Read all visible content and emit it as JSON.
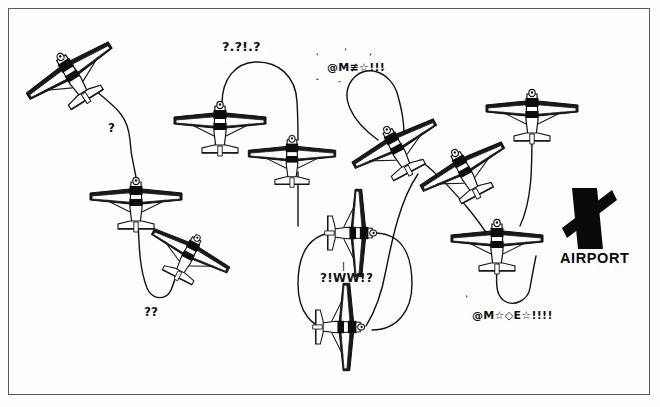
{
  "page": {
    "width": 660,
    "height": 407,
    "background_color": "#fdfdfc",
    "border_color": "#5a5a5a",
    "ink_color": "#111111"
  },
  "airport_marker": {
    "label": "AIRPORT",
    "icon": "crossed-runways-icon",
    "x": 560,
    "y": 185
  },
  "annotations": [
    {
      "name": "question-mark-left",
      "text": "?",
      "x": 108,
      "y": 122,
      "size": 12,
      "kind": "question"
    },
    {
      "name": "grawlix-top-center",
      "text": "?.?!.?",
      "x": 222,
      "y": 40,
      "size": 13,
      "kind": "question"
    },
    {
      "name": "grawlix-top-right",
      "text": "@M≢☆!!!",
      "x": 327,
      "y": 62,
      "size": 11,
      "kind": "grawlix"
    },
    {
      "name": "question-marks-lower-left",
      "text": "??",
      "x": 144,
      "y": 306,
      "size": 12,
      "kind": "question"
    },
    {
      "name": "grawlix-center",
      "text": "?!WW!?",
      "x": 320,
      "y": 272,
      "size": 12,
      "kind": "grawlix"
    },
    {
      "name": "grawlix-bottom-right",
      "text": "@M☆◇E☆!!!!",
      "x": 472,
      "y": 310,
      "size": 11,
      "kind": "grawlix"
    }
  ],
  "aircraft": [
    {
      "name": "aircraft-upper-left",
      "x": 70,
      "y": 72,
      "rot": -32,
      "scale": 1.05,
      "view": "underside"
    },
    {
      "name": "aircraft-left-mid",
      "x": 136,
      "y": 198,
      "rot": 0,
      "scale": 1.0,
      "view": "underside"
    },
    {
      "name": "aircraft-left-lower",
      "x": 190,
      "y": 252,
      "rot": 27,
      "scale": 0.92,
      "view": "underside"
    },
    {
      "name": "aircraft-top-center",
      "x": 220,
      "y": 122,
      "rot": 0,
      "scale": 1.0,
      "view": "underside"
    },
    {
      "name": "aircraft-center-upper",
      "x": 292,
      "y": 155,
      "rot": 0,
      "scale": 0.95,
      "view": "underside"
    },
    {
      "name": "aircraft-mid-loop-top",
      "x": 357,
      "y": 233,
      "rot": 90,
      "scale": 0.95,
      "view": "underside"
    },
    {
      "name": "aircraft-mid-loop-bot",
      "x": 345,
      "y": 327,
      "rot": 90,
      "scale": 0.95,
      "view": "underside"
    },
    {
      "name": "aircraft-diag-left",
      "x": 395,
      "y": 145,
      "rot": -28,
      "scale": 1.0,
      "view": "underside"
    },
    {
      "name": "aircraft-diag-right",
      "x": 463,
      "y": 168,
      "rot": -28,
      "scale": 1.0,
      "view": "underside"
    },
    {
      "name": "aircraft-right-upper",
      "x": 532,
      "y": 110,
      "rot": 0,
      "scale": 1.0,
      "view": "underside"
    },
    {
      "name": "aircraft-right-lower",
      "x": 497,
      "y": 240,
      "rot": 0,
      "scale": 1.0,
      "view": "underside"
    }
  ],
  "tethers": [
    {
      "name": "tether-upper-left-to-left-mid",
      "path": "M 92 88 C 120 110 128 118 130 140 C 131 160 135 168 136 178"
    },
    {
      "name": "tether-left-mid-to-hook",
      "path": "M 138 218 C 139 250 140 270 147 288 C 152 300 166 301 171 290 C 176 278 178 268 180 262"
    },
    {
      "name": "tether-top-center-arc",
      "path": "M 222 104 C 222 78 236 63 255 62 C 278 61 296 76 297 102 C 298 118 298 128 298 140"
    },
    {
      "name": "tether-center-down",
      "path": "M 298 172 C 298 196 298 210 298 226"
    },
    {
      "name": "tether-loop-left",
      "path": "M 340 232 C 306 232 298 258 298 284 C 298 312 312 330 336 330"
    },
    {
      "name": "tether-loop-right",
      "path": "M 376 233 C 404 234 412 258 412 284 C 412 312 396 330 372 330"
    },
    {
      "name": "tether-big-arc-left",
      "path": "M 378 140 C 350 120 340 96 352 80 C 366 62 392 72 398 96 C 404 118 404 128 404 140"
    },
    {
      "name": "tether-diag-down",
      "path": "M 420 160 C 440 176 452 190 466 206 C 478 220 486 232 494 244"
    },
    {
      "name": "tether-right-upper-down",
      "path": "M 532 128 C 532 170 532 200 520 226"
    },
    {
      "name": "tether-right-lower-hook",
      "path": "M 497 258 C 497 278 494 292 503 300 C 514 308 528 300 530 288 C 532 276 534 266 536 256"
    },
    {
      "name": "tether-mid-right-curve",
      "path": "M 418 174 C 400 200 392 240 386 270 C 382 292 376 310 366 326"
    }
  ]
}
